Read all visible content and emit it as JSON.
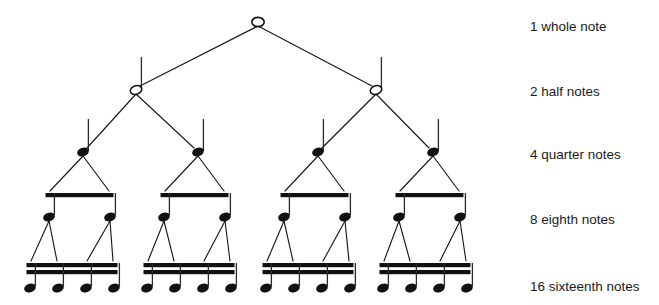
{
  "diagram": {
    "background_color": "#ffffff",
    "ink_color": "#111111",
    "label_color": "#1a1a1a",
    "label_x": 530,
    "rows": [
      {
        "id": "whole",
        "label": "1 whole note",
        "label_y": 27,
        "count": 1,
        "note_type": "whole",
        "head_filled": false,
        "has_stem": false,
        "beams": 0,
        "note_y": 22,
        "note_x": [
          258
        ]
      },
      {
        "id": "half",
        "label": "2 half notes",
        "label_y": 92,
        "count": 2,
        "note_type": "half",
        "head_filled": false,
        "has_stem": true,
        "beams": 0,
        "note_y": 90,
        "note_x": [
          136,
          376
        ]
      },
      {
        "id": "quarter",
        "label": "4 quarter notes",
        "label_y": 155,
        "count": 4,
        "note_type": "quarter",
        "head_filled": true,
        "has_stem": true,
        "beams": 0,
        "note_y": 152,
        "note_x": [
          83,
          198,
          318,
          433
        ]
      },
      {
        "id": "eighth",
        "label": "8 eighth notes",
        "label_y": 220,
        "count": 8,
        "note_type": "eighth",
        "head_filled": true,
        "has_stem": true,
        "beams": 1,
        "note_y": 217,
        "beam_y": 193,
        "note_x": [
          49,
          110,
          164,
          225,
          284,
          345,
          399,
          460
        ],
        "beam_groups": [
          [
            49,
            110
          ],
          [
            164,
            225
          ],
          [
            284,
            345
          ],
          [
            399,
            460
          ]
        ]
      },
      {
        "id": "sixteenth",
        "label": "16 sixteenth notes",
        "label_y": 287,
        "count": 16,
        "note_type": "sixteenth",
        "head_filled": true,
        "has_stem": true,
        "beams": 2,
        "note_y": 288,
        "beam_y": 263,
        "note_x": [
          30,
          58,
          86,
          114,
          147,
          175,
          203,
          231,
          266,
          294,
          322,
          350,
          383,
          411,
          439,
          467
        ],
        "beam_groups": [
          [
            30,
            114
          ],
          [
            147,
            231
          ],
          [
            266,
            350
          ],
          [
            383,
            467
          ]
        ]
      }
    ],
    "edges": [
      {
        "from_row": "whole",
        "from_x": 258,
        "from_y": 26,
        "to_row": "half",
        "to_x": 140,
        "to_y": 86
      },
      {
        "from_row": "whole",
        "from_x": 258,
        "from_y": 26,
        "to_row": "half",
        "to_x": 372,
        "to_y": 86
      },
      {
        "from_row": "half",
        "from_x": 136,
        "from_y": 94,
        "to_row": "quarter",
        "to_x": 87,
        "to_y": 148
      },
      {
        "from_row": "half",
        "from_x": 136,
        "from_y": 94,
        "to_row": "quarter",
        "to_x": 194,
        "to_y": 148
      },
      {
        "from_row": "half",
        "from_x": 376,
        "from_y": 94,
        "to_row": "quarter",
        "to_x": 322,
        "to_y": 148
      },
      {
        "from_row": "half",
        "from_x": 376,
        "from_y": 94,
        "to_row": "quarter",
        "to_x": 429,
        "to_y": 148
      },
      {
        "from_row": "quarter",
        "from_x": 83,
        "from_y": 156,
        "to_row": "eighth",
        "to_x": 50,
        "to_y": 191
      },
      {
        "from_row": "quarter",
        "from_x": 83,
        "from_y": 156,
        "to_row": "eighth",
        "to_x": 109,
        "to_y": 191
      },
      {
        "from_row": "quarter",
        "from_x": 198,
        "from_y": 156,
        "to_row": "eighth",
        "to_x": 165,
        "to_y": 191
      },
      {
        "from_row": "quarter",
        "from_x": 198,
        "from_y": 156,
        "to_row": "eighth",
        "to_x": 224,
        "to_y": 191
      },
      {
        "from_row": "quarter",
        "from_x": 318,
        "from_y": 156,
        "to_row": "eighth",
        "to_x": 285,
        "to_y": 191
      },
      {
        "from_row": "quarter",
        "from_x": 318,
        "from_y": 156,
        "to_row": "eighth",
        "to_x": 344,
        "to_y": 191
      },
      {
        "from_row": "quarter",
        "from_x": 433,
        "from_y": 156,
        "to_row": "eighth",
        "to_x": 400,
        "to_y": 191
      },
      {
        "from_row": "quarter",
        "from_x": 433,
        "from_y": 156,
        "to_row": "eighth",
        "to_x": 459,
        "to_y": 191
      },
      {
        "from_row": "eighth",
        "from_x": 49,
        "from_y": 221,
        "to_row": "sixteenth",
        "to_x": 31,
        "to_y": 261
      },
      {
        "from_row": "eighth",
        "from_x": 49,
        "from_y": 221,
        "to_row": "sixteenth",
        "to_x": 57,
        "to_y": 261
      },
      {
        "from_row": "eighth",
        "from_x": 110,
        "from_y": 221,
        "to_row": "sixteenth",
        "to_x": 87,
        "to_y": 261
      },
      {
        "from_row": "eighth",
        "from_x": 110,
        "from_y": 221,
        "to_row": "sixteenth",
        "to_x": 113,
        "to_y": 261
      },
      {
        "from_row": "eighth",
        "from_x": 164,
        "from_y": 221,
        "to_row": "sixteenth",
        "to_x": 148,
        "to_y": 261
      },
      {
        "from_row": "eighth",
        "from_x": 164,
        "from_y": 221,
        "to_row": "sixteenth",
        "to_x": 174,
        "to_y": 261
      },
      {
        "from_row": "eighth",
        "from_x": 225,
        "from_y": 221,
        "to_row": "sixteenth",
        "to_x": 204,
        "to_y": 261
      },
      {
        "from_row": "eighth",
        "from_x": 225,
        "from_y": 221,
        "to_row": "sixteenth",
        "to_x": 230,
        "to_y": 261
      },
      {
        "from_row": "eighth",
        "from_x": 284,
        "from_y": 221,
        "to_row": "sixteenth",
        "to_x": 267,
        "to_y": 261
      },
      {
        "from_row": "eighth",
        "from_x": 284,
        "from_y": 221,
        "to_row": "sixteenth",
        "to_x": 293,
        "to_y": 261
      },
      {
        "from_row": "eighth",
        "from_x": 345,
        "from_y": 221,
        "to_row": "sixteenth",
        "to_x": 323,
        "to_y": 261
      },
      {
        "from_row": "eighth",
        "from_x": 345,
        "from_y": 221,
        "to_row": "sixteenth",
        "to_x": 349,
        "to_y": 261
      },
      {
        "from_row": "eighth",
        "from_x": 399,
        "from_y": 221,
        "to_row": "sixteenth",
        "to_x": 384,
        "to_y": 261
      },
      {
        "from_row": "eighth",
        "from_x": 399,
        "from_y": 221,
        "to_row": "sixteenth",
        "to_x": 410,
        "to_y": 261
      },
      {
        "from_row": "eighth",
        "from_x": 460,
        "from_y": 221,
        "to_row": "sixteenth",
        "to_x": 440,
        "to_y": 261
      },
      {
        "from_row": "eighth",
        "from_x": 460,
        "from_y": 221,
        "to_row": "sixteenth",
        "to_x": 466,
        "to_y": 261
      }
    ]
  }
}
